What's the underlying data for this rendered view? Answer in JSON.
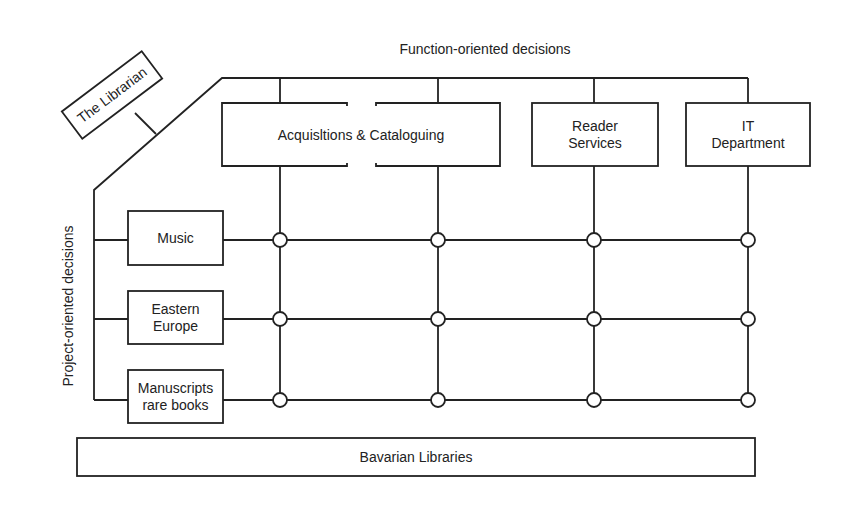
{
  "titles": {
    "function_axis": "Function-oriented decisions",
    "project_axis": "Project-oriented decisions"
  },
  "top": {
    "label": "The Librarian"
  },
  "functions": [
    {
      "id": "acq",
      "lines": [
        "Acquisltions & Cataloguing"
      ]
    },
    {
      "id": "reader",
      "lines": [
        "Reader",
        "Services"
      ]
    },
    {
      "id": "it",
      "lines": [
        "IT",
        "Department"
      ]
    }
  ],
  "projects": [
    {
      "id": "music",
      "lines": [
        "Music"
      ]
    },
    {
      "id": "eastern",
      "lines": [
        "Eastern",
        "Europe"
      ]
    },
    {
      "id": "manuscripts",
      "lines": [
        "Manuscripts",
        "rare books"
      ]
    }
  ],
  "base": {
    "label": "Bavarian Libraries"
  },
  "matrix": {
    "columns": 4,
    "rows": 3,
    "node_shape": "circle"
  },
  "colors": {
    "stroke": "#222222",
    "background": "#ffffff"
  }
}
